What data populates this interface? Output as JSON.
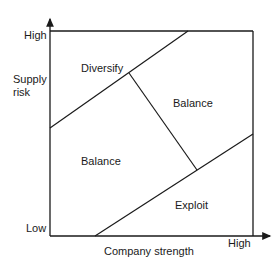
{
  "diagram": {
    "type": "matrix",
    "y_axis": {
      "title_line1": "Supply",
      "title_line2": "risk",
      "high": "High",
      "low": "Low"
    },
    "x_axis": {
      "title": "Company strength",
      "high": "High"
    },
    "regions": [
      {
        "id": "diversify",
        "label": "Diversify"
      },
      {
        "id": "balance-upper",
        "label": "Balance"
      },
      {
        "id": "balance-lower",
        "label": "Balance"
      },
      {
        "id": "exploit",
        "label": "Exploit"
      }
    ],
    "line_color": "#1a1a1a"
  }
}
